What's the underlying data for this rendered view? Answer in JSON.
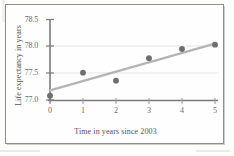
{
  "figure": {
    "kind": "scatter-plot-with-trend-line",
    "frame_border_color": "#8e8e8e",
    "background_color": "#fefefe"
  },
  "chart_data": {
    "type": "scatter",
    "title": "",
    "xlabel": "Time in years since 2003",
    "ylabel": "Life expectancy in years",
    "xlim": [
      0,
      5
    ],
    "ylim": [
      77.0,
      78.5
    ],
    "xticks": [
      "0",
      "1",
      "2",
      "3",
      "4",
      "5"
    ],
    "yticks": [
      "78.5",
      "78.0",
      "77.5",
      "77.0"
    ],
    "xtick_values": [
      0,
      1,
      2,
      3,
      4,
      5
    ],
    "ytick_values": [
      78.5,
      78.0,
      77.5,
      77.0
    ],
    "grid": "faint-horizontal",
    "legend": "none",
    "x": [
      0,
      1,
      2,
      3,
      4,
      5
    ],
    "y": [
      77.08,
      77.51,
      77.36,
      77.78,
      77.95,
      78.03
    ],
    "points": [
      {
        "x": 0,
        "y": 77.08
      },
      {
        "x": 1,
        "y": 77.51
      },
      {
        "x": 2,
        "y": 77.36
      },
      {
        "x": 3,
        "y": 77.78
      },
      {
        "x": 4,
        "y": 77.95
      },
      {
        "x": 5,
        "y": 78.03
      }
    ],
    "series": [
      {
        "name": "Life expectancy data points",
        "type": "scatter",
        "marker": "filled-circle",
        "color": "#6e6e6e",
        "values": [
          77.08,
          77.51,
          77.36,
          77.78,
          77.95,
          78.03
        ]
      },
      {
        "name": "Line of best fit",
        "type": "line",
        "color": "#b4b4b4",
        "x_endpoints": [
          0,
          5
        ],
        "y_endpoints": [
          77.18,
          78.05
        ]
      }
    ],
    "axis_color": "#7a7a7a",
    "marker_color": "#6e6e6e",
    "trendline_color": "#b4b4b4",
    "gridline_color": "#e6e2de"
  }
}
